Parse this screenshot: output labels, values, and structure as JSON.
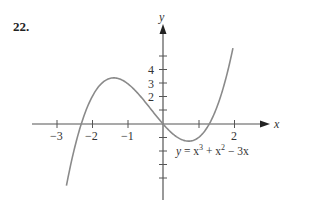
{
  "problem": {
    "number": "22."
  },
  "chart_data": {
    "type": "line",
    "title": "",
    "equation_label": "y = x³ + x² − 3x",
    "xlabel": "x",
    "ylabel": "y",
    "xlim": [
      -3.1,
      2.0
    ],
    "ylim": [
      -5.0,
      5.5
    ],
    "x_ticks": [
      -3,
      -2,
      -1,
      0,
      1,
      2
    ],
    "x_tick_labels": [
      "−3",
      "−2",
      "−1",
      "",
      "",
      "2"
    ],
    "y_ticks": [
      -4,
      -3,
      -2,
      -1,
      1,
      2,
      3,
      4,
      5
    ],
    "y_tick_labels": [
      "",
      "",
      "",
      "",
      "",
      "2",
      "3",
      "4",
      ""
    ],
    "grid": false,
    "series": [
      {
        "name": "y = x^3 + x^2 - 3x",
        "x": [
          -2.7,
          -2.5,
          -2.3,
          -2.0,
          -1.7,
          -1.5,
          -1.3,
          -1.0,
          -0.5,
          0.0,
          0.5,
          0.72,
          1.0,
          1.3,
          1.5,
          1.75,
          1.9
        ],
        "y": [
          -4.22,
          -2.875,
          -1.58,
          2.0,
          2.077,
          3.375,
          3.403,
          3.0,
          1.625,
          0.0,
          -1.125,
          -1.27,
          -1.0,
          0.0,
          1.125,
          2.25,
          5.0
        ]
      }
    ]
  },
  "labels": {
    "x_axis": "x",
    "y_axis": "y",
    "equation": {
      "y": "y",
      "eq": " = x",
      "exp1": "3",
      "plus": " + x",
      "exp2": "2",
      "tail": " − 3x"
    },
    "x_ticks": {
      "m3": "−3",
      "m2": "−2",
      "m1": "−1",
      "p2": "2"
    },
    "y_ticks": {
      "p2": "2",
      "p3": "3",
      "p4": "4"
    }
  }
}
